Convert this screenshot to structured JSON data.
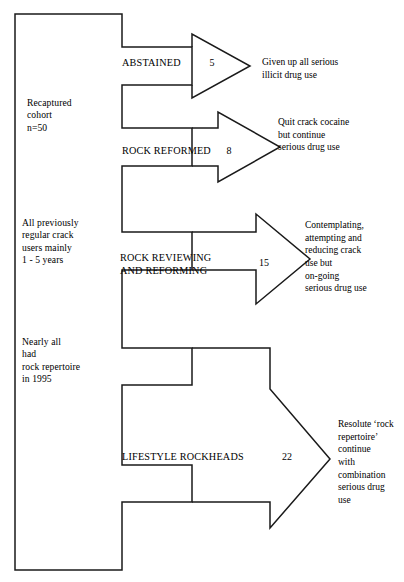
{
  "figure": {
    "type": "flow-diagram",
    "title": "",
    "cohort_notes": [
      {
        "id": "recaptured",
        "text": "  Recaptured\ncohort\nn=50",
        "x": 27,
        "y": 97
      },
      {
        "id": "previous-use",
        "text": "All previously\nregular crack\nusers mainly\n1 - 5 years",
        "x": 22,
        "y": 217
      },
      {
        "id": "rock-repertoire",
        "text": "Nearly all\nhad\nrock repertoire\nin 1995",
        "x": 22,
        "y": 336
      }
    ],
    "branches": [
      {
        "id": "abstained",
        "label": "ABSTAINED",
        "count": "5",
        "outcome": "Given up all serious\nillicit drug use",
        "label_x": 122,
        "label_y": 56,
        "count_x": 205,
        "count_y": 57,
        "outcome_x": 262,
        "outcome_y": 56
      },
      {
        "id": "rock-reformed",
        "label": "ROCK REFORMED",
        "count": "8",
        "outcome": "Quit crack cocaine\n but continue\nserious drug use",
        "label_x": 122,
        "label_y": 144,
        "count_x": 222,
        "count_y": 145,
        "outcome_x": 278,
        "outcome_y": 116
      },
      {
        "id": "rock-reviewing-and-reforming",
        "label": "ROCK REVIEWING\nAND REFORMING",
        "count": "15",
        "outcome": "Contemplating,\nattempting and\nreducing crack\nuse but\non-going\nserious drug use",
        "label_x": 120,
        "label_y": 251,
        "count_x": 255,
        "count_y": 257,
        "outcome_x": 305,
        "outcome_y": 219
      },
      {
        "id": "lifestyle-rockheads",
        "label": "LIFESTYLE ROCKHEADS",
        "count": "22",
        "outcome": "Resolute ‘rock\nrepertoire’\ncontinue\nwith\ncombination\nserious drug\nuse",
        "label_x": 122,
        "label_y": 450,
        "count_x": 278,
        "count_y": 451,
        "outcome_x": 303,
        "outcome_y": 418
      }
    ],
    "colors": {
      "stroke": "#1a1a1a",
      "text": "#000000",
      "background": "#ffffff"
    },
    "geometry": {
      "bracket_left_x": 15,
      "bracket_top_y": 14,
      "bracket_bottom_y": 570,
      "bracket_right_x": 122
    }
  }
}
